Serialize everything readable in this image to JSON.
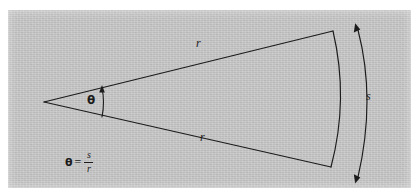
{
  "figure": {
    "kind": "geometry-diagram",
    "plate": {
      "background_color": "#c4c4c4",
      "page_color": "#ffffff",
      "ink_color": "#1b1b1b",
      "left": 8,
      "top": 10,
      "width": 403,
      "height": 178
    },
    "labels": {
      "radius_upper": "r",
      "radius_lower": "r",
      "arc_length": "s",
      "angle": "θ"
    },
    "equation": {
      "lhs": "θ",
      "relation": "=",
      "numerator": "s",
      "denominator": "r",
      "plain": "θ = s/r"
    },
    "geometry": {
      "vertex": {
        "x": 44,
        "y": 102
      },
      "upper_radius_end": {
        "x": 333,
        "y": 31
      },
      "lower_radius_end": {
        "x": 331,
        "y": 167
      },
      "sector_arc": {
        "bulge_x": 348,
        "bulge_y": 99
      },
      "angle_marker_arc": {
        "x": 102,
        "y_top": 85,
        "y_bottom": 117
      },
      "dimension_arrow": {
        "x_top": 356,
        "y_top": 24,
        "x_bottom": 356,
        "y_bottom": 176,
        "bulge_x": 374
      }
    },
    "label_positions": {
      "radius_upper": {
        "x": 196,
        "y": 45
      },
      "radius_lower": {
        "x": 200,
        "y": 139
      },
      "arc_length": {
        "x": 366,
        "y": 96
      },
      "angle": {
        "x": 87,
        "y": 94
      }
    }
  }
}
